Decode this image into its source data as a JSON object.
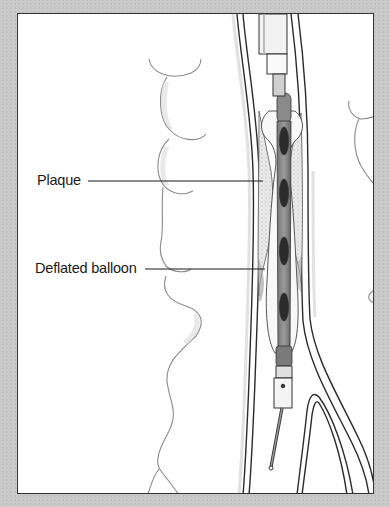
{
  "figure": {
    "type": "medical-illustration",
    "labels": [
      {
        "id": "plaque",
        "text": "Plaque"
      },
      {
        "id": "deflated_balloon",
        "text": "Deflated balloon"
      }
    ]
  },
  "colors": {
    "background": "#c9c9c9",
    "frame_fill": "#ffffff",
    "frame_border": "#333333",
    "label_text": "#1a1a1a",
    "vessel_wall": "#2a2a2a",
    "balloon_dark": "#5a5a5a",
    "plaque_fill": "#e6e6e6"
  }
}
